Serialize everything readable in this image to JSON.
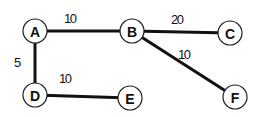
{
  "graph": {
    "nodes": [
      {
        "id": "A",
        "label": "A",
        "x": 35,
        "y": 31
      },
      {
        "id": "B",
        "label": "B",
        "x": 132,
        "y": 31
      },
      {
        "id": "C",
        "label": "C",
        "x": 230,
        "y": 33
      },
      {
        "id": "D",
        "label": "D",
        "x": 35,
        "y": 95
      },
      {
        "id": "E",
        "label": "E",
        "x": 130,
        "y": 98
      },
      {
        "id": "F",
        "label": "F",
        "x": 235,
        "y": 97
      }
    ],
    "edges": [
      {
        "from": "A",
        "to": "B",
        "weight": "10",
        "label_x": 64,
        "label_y": 23
      },
      {
        "from": "B",
        "to": "C",
        "weight": "20",
        "label_x": 171,
        "label_y": 24
      },
      {
        "from": "B",
        "to": "F",
        "weight": "10",
        "label_x": 178,
        "label_y": 59
      },
      {
        "from": "A",
        "to": "D",
        "weight": "5",
        "label_x": 14,
        "label_y": 67
      },
      {
        "from": "D",
        "to": "E",
        "weight": "10",
        "label_x": 59,
        "label_y": 83
      }
    ],
    "colors": {
      "edge": "#111111",
      "node_stroke": "#222222",
      "node_fill": "#ffffff",
      "text": "#111111"
    }
  }
}
